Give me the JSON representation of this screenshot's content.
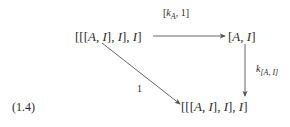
{
  "diagram": {
    "equation_number": "(1.4)",
    "nodes": {
      "top_left": {
        "prefix": "[[[",
        "A": "A",
        "sep1": ", ",
        "I1": "I",
        "mid1": "], ",
        "I2": "I",
        "mid2": "], ",
        "I3": "I",
        "suffix": "]"
      },
      "top_right": {
        "prefix": "[",
        "A": "A",
        "sep": ", ",
        "I": "I",
        "suffix": "]"
      },
      "bottom": {
        "prefix": "[[[",
        "A": "A",
        "sep1": ", ",
        "I1": "I",
        "mid1": "], ",
        "I2": "I",
        "mid2": "], ",
        "I3": "I",
        "suffix": "]"
      }
    },
    "arrows": {
      "top": {
        "open": "[",
        "k": "k",
        "sub": "A",
        "rest": ", 1]"
      },
      "right": {
        "k": "k",
        "sub": "[A, I]"
      },
      "diagonal": {
        "label": "1"
      }
    },
    "colors": {
      "ink": "#2a2a2a",
      "arrow": "#555555"
    }
  }
}
